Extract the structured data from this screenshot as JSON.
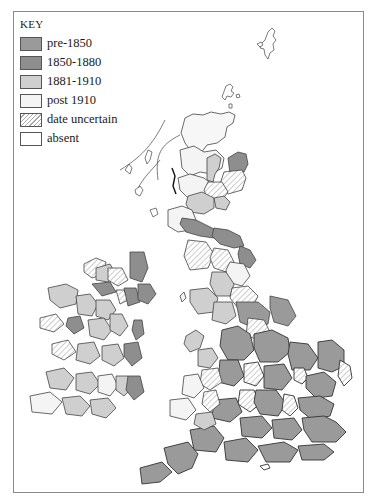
{
  "key": {
    "title": "KEY",
    "items": [
      {
        "label": "pre-1850",
        "fill": "#9a9a9a",
        "pattern": "solid"
      },
      {
        "label": "1850-1880",
        "fill": "#8e8e8e",
        "pattern": "solid"
      },
      {
        "label": "1881-1910",
        "fill": "#cfcfcf",
        "pattern": "solid"
      },
      {
        "label": "post 1910",
        "fill": "#f4f4f4",
        "pattern": "solid"
      },
      {
        "label": "date uncertain",
        "fill": "#ffffff",
        "pattern": "hatch"
      },
      {
        "label": "absent",
        "fill": "#ffffff",
        "pattern": "solid"
      }
    ]
  },
  "map": {
    "regions": [
      "Great Britain",
      "Ireland",
      "Shetland",
      "Orkney"
    ],
    "colors": {
      "pre1850": "#9a9a9a",
      "c1850_1880": "#8e8e8e",
      "c1881_1910": "#cfcfcf",
      "post1910": "#f4f4f4",
      "absent": "#ffffff",
      "border": "#333333"
    }
  }
}
